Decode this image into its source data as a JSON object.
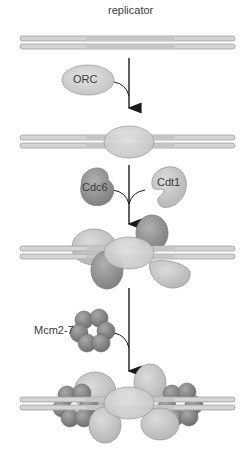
{
  "diagram": {
    "steps": [
      {
        "id": "replicator",
        "label": "replicator",
        "description": "Replicator DNA sequence (double strand)"
      },
      {
        "id": "orc-binding",
        "label": "ORC",
        "description": "ORC binds the replicator"
      },
      {
        "id": "cdc6-cdt1-binding",
        "labels": [
          "Cdc6",
          "Cdt1"
        ],
        "description": "Cdc6 and Cdt1 join ORC"
      },
      {
        "id": "mcm-loading",
        "label": "Mcm2-7",
        "description": "Mcm2-7 helicase loaded onto DNA"
      }
    ],
    "labels": {
      "replicator": "replicator",
      "orc": "ORC",
      "cdc6": "Cdc6",
      "cdt1": "Cdt1",
      "mcm": "Mcm2-7"
    },
    "colors": {
      "dna_outer": "#cfcfcf",
      "dna_inner": "#dcdcdc",
      "orc": "#d6d6d6",
      "cdc6": "#9a9a9a",
      "cdt1": "#c8c8c8",
      "mcm": "#8e8e8e",
      "arrow": "#1a1a1a",
      "text": "#3a3a3a"
    }
  }
}
